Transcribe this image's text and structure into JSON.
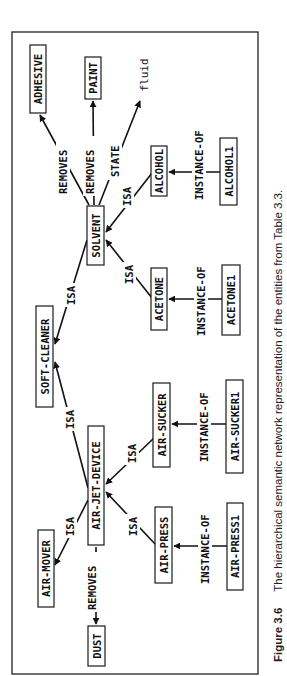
{
  "figure": {
    "label": "Figure 3.6",
    "caption": "The hierarchical semantic network representation of the entities from Table 3.3.",
    "orientation": "rotated 90deg counter-clockwise"
  },
  "nodes": {
    "adhesive": "ADHESIVE",
    "paint": "PAINT",
    "fluid": "fluid",
    "solvent": "SOLVENT",
    "alcohol": "ALCOHOL",
    "alcohol1": "ALCOHOL1",
    "acetone": "ACETONE",
    "acetone1": "ACETONE1",
    "soft_cleaner": "SOFT-CLEANER",
    "air_sucker": "AIR-SUCKER",
    "air_sucker1": "AIR-SUCKER1",
    "air_jet_device": "AIR-JET-DEVICE",
    "air_mover": "AIR-MOVER",
    "air_press": "AIR-PRESS",
    "air_press1": "AIR-PRESS1",
    "dust": "DUST"
  },
  "edges": [
    {
      "from": "SOLVENT",
      "to": "ADHESIVE",
      "label": "REMOVES"
    },
    {
      "from": "SOLVENT",
      "to": "PAINT",
      "label": "REMOVES"
    },
    {
      "from": "SOLVENT",
      "to": "fluid",
      "label": "STATE"
    },
    {
      "from": "ALCOHOL",
      "to": "SOLVENT",
      "label": "ISA"
    },
    {
      "from": "ACETONE",
      "to": "SOLVENT",
      "label": "ISA"
    },
    {
      "from": "ALCOHOL1",
      "to": "ALCOHOL",
      "label": "INSTANCE-OF"
    },
    {
      "from": "ACETONE1",
      "to": "ACETONE",
      "label": "INSTANCE-OF"
    },
    {
      "from": "SOLVENT",
      "to": "SOFT-CLEANER",
      "label": "ISA"
    },
    {
      "from": "AIR-JET-DEVICE",
      "to": "SOFT-CLEANER",
      "label": "ISA"
    },
    {
      "from": "AIR-JET-DEVICE",
      "to": "AIR-MOVER",
      "label": "ISA"
    },
    {
      "from": "AIR-SUCKER",
      "to": "AIR-JET-DEVICE",
      "label": "ISA"
    },
    {
      "from": "AIR-PRESS",
      "to": "AIR-JET-DEVICE",
      "label": "ISA"
    },
    {
      "from": "AIR-SUCKER1",
      "to": "AIR-SUCKER",
      "label": "INSTANCE-OF"
    },
    {
      "from": "AIR-PRESS1",
      "to": "AIR-PRESS",
      "label": "INSTANCE-OF"
    },
    {
      "from": "AIR-JET-DEVICE",
      "to": "DUST",
      "label": "REMOVES"
    }
  ],
  "labels": {
    "removes": "REMOVES",
    "state": "STATE",
    "isa": "ISA",
    "instance_of": "INSTANCE-OF"
  },
  "colors": {
    "ink": "#111111",
    "background": "#ffffff"
  }
}
